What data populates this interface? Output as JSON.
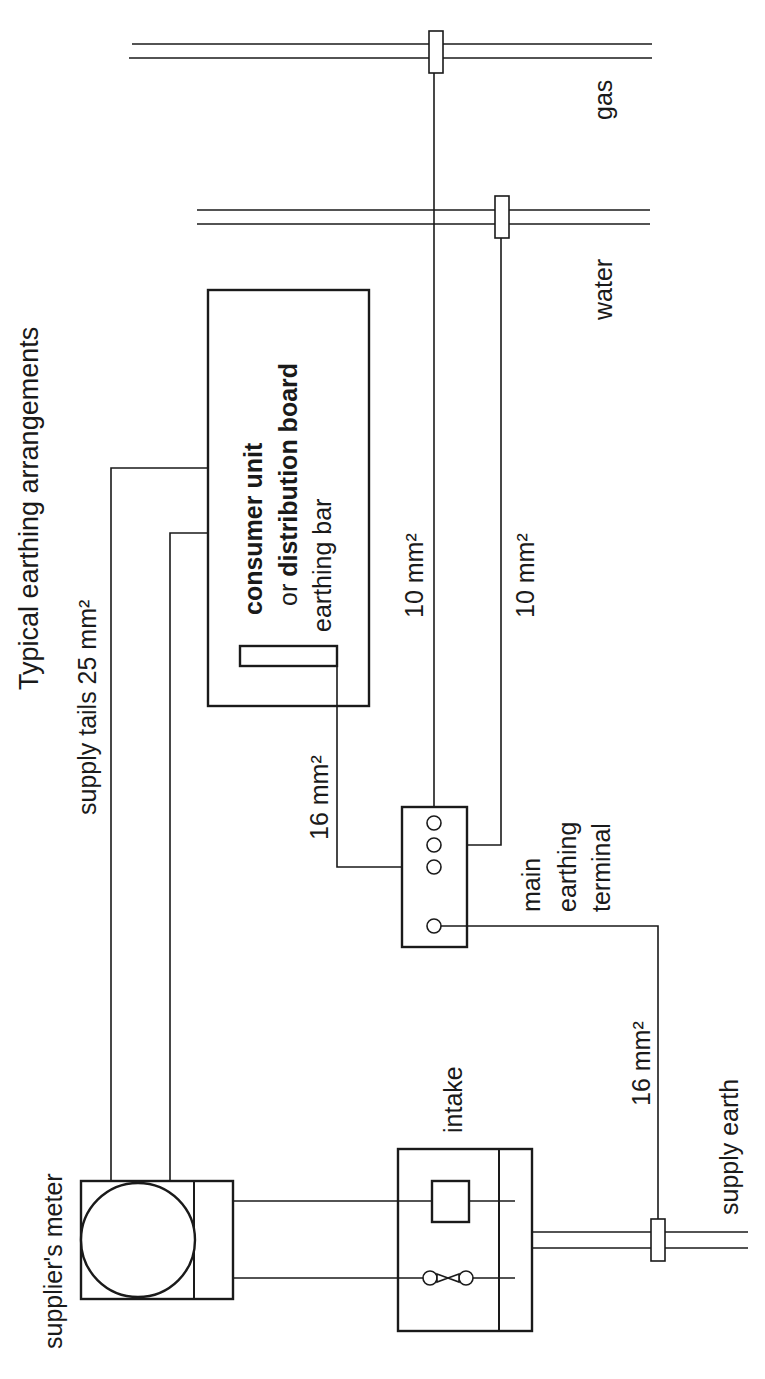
{
  "diagram": {
    "title": "Typical earthing arrangements",
    "orientation": "rotated 90° counter-clockwise",
    "labels": {
      "supply_tails": "supply tails 25 mm²",
      "consumer_unit_line1": "consumer unit",
      "consumer_unit_line2_prefix": "or ",
      "consumer_unit_line2_bold": "distribution board",
      "earthing_bar": "earthing bar",
      "cu_to_met_cable": "16 mm²",
      "gas_bond_cable": "10 mm²",
      "water_bond_cable": "10 mm²",
      "met_line1": "main",
      "met_line2": "earthing",
      "met_line3": "terminal",
      "earth_conductor_cable": "16 mm²",
      "supply_earth": "supply earth",
      "intake": "intake",
      "suppliers_meter": "supplier's meter",
      "water": "water",
      "gas": "gas"
    },
    "components": [
      {
        "id": "suppliers-meter",
        "label": "supplier's meter"
      },
      {
        "id": "intake",
        "label": "intake"
      },
      {
        "id": "consumer-unit",
        "label": "consumer unit or distribution board"
      },
      {
        "id": "earthing-bar",
        "label": "earthing bar"
      },
      {
        "id": "main-earthing-terminal",
        "label": "main earthing terminal",
        "terminals": 4
      },
      {
        "id": "water-pipe",
        "label": "water",
        "clamp": true
      },
      {
        "id": "gas-pipe",
        "label": "gas",
        "clamp": true
      },
      {
        "id": "supply-earth",
        "label": "supply earth",
        "clamp": true
      }
    ],
    "connections": [
      {
        "from": "suppliers-meter",
        "to": "consumer-unit",
        "size": "25 mm²",
        "count": 2
      },
      {
        "from": "earthing-bar",
        "to": "main-earthing-terminal",
        "size": "16 mm²"
      },
      {
        "from": "main-earthing-terminal",
        "to": "gas-pipe",
        "size": "10 mm²"
      },
      {
        "from": "main-earthing-terminal",
        "to": "water-pipe",
        "size": "10 mm²"
      },
      {
        "from": "main-earthing-terminal",
        "to": "supply-earth",
        "size": "16 mm²"
      },
      {
        "from": "intake",
        "to": "suppliers-meter",
        "count": 2
      }
    ]
  }
}
